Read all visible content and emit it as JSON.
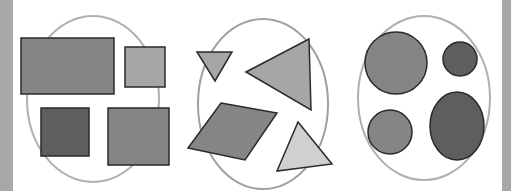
{
  "colors": {
    "strip": "#a8a8a8",
    "ellipse_stroke": "#b0b0b0",
    "outline": "#2a2a2a",
    "dark": "#5e5e5e",
    "mid": "#858585",
    "light": "#a6a6a6",
    "lighter": "#d0d0d0"
  },
  "groups": [
    {
      "name": "rectangles",
      "count": 4
    },
    {
      "name": "triangles-and-parallelogram",
      "count": 4
    },
    {
      "name": "circles",
      "count": 4
    }
  ]
}
